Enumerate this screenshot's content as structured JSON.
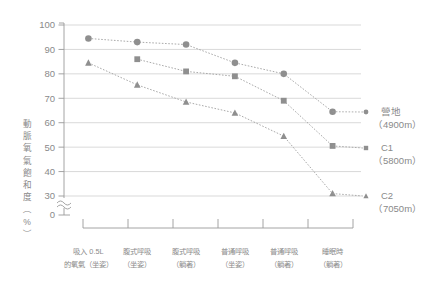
{
  "chart_data": {
    "type": "line",
    "title": "",
    "xlabel": "",
    "ylabel": "動脈氧氣飽和度（%）",
    "ylabel_chars": [
      "動",
      "脈",
      "氧",
      "氣",
      "飽",
      "和",
      "度",
      "（",
      "%",
      "）"
    ],
    "ylim": [
      30,
      100
    ],
    "grid": true,
    "axis_break": true,
    "axis_break_symbol": "≈",
    "legend_position": "right",
    "ytick_labels": [
      "100",
      "90",
      "80",
      "70",
      "60",
      "50",
      "40",
      "30",
      "0"
    ],
    "ytick_values": [
      100,
      90,
      80,
      70,
      60,
      50,
      40,
      30,
      0
    ],
    "categories": [
      "吸入 0.5L\n的氧氣（坐姿）",
      "腹式呼吸\n（坐姿）",
      "腹式呼吸\n（躺著）",
      "普通呼吸\n（坐姿）",
      "普通呼吸\n（躺著）",
      "睡眠時\n（躺著）"
    ],
    "categories_lines": [
      [
        "吸入 0.5L",
        "的氧氣（坐姿）"
      ],
      [
        "腹式呼吸",
        "（坐姿）"
      ],
      [
        "腹式呼吸",
        "（躺著）"
      ],
      [
        "普通呼吸",
        "（坐姿）"
      ],
      [
        "普通呼吸",
        "（躺著）"
      ],
      [
        "睡眠時",
        "（躺著）"
      ]
    ],
    "series": [
      {
        "name": "營地",
        "altitude": "（4900m）",
        "marker": "circle",
        "color": "#8f8f8f",
        "values": [
          94.5,
          93,
          92,
          84.5,
          80,
          64.5
        ]
      },
      {
        "name": "C1",
        "altitude": "（5800m）",
        "marker": "square",
        "color": "#8f8f8f",
        "values": [
          null,
          86,
          81,
          79,
          69,
          50.5
        ]
      },
      {
        "name": "C2",
        "altitude": "（7050m）",
        "marker": "triangle",
        "color": "#8f8f8f",
        "values": [
          84.5,
          75.5,
          68.5,
          64,
          54.5,
          31
        ]
      }
    ]
  },
  "legend": {
    "items": [
      {
        "label": "營地",
        "sublabel": "（4900m）",
        "marker": "circle-marker-icon"
      },
      {
        "label": "C1",
        "sublabel": "（5800m）",
        "marker": "square-marker-icon"
      },
      {
        "label": "C2",
        "sublabel": "（7050m）",
        "marker": "triangle-marker-icon"
      }
    ]
  },
  "colors": {
    "marker": "#8f8f8f",
    "line": "#9b9b9b",
    "grid": "#cfcfcf",
    "axis": "#9a9a9a",
    "text": "#8a8a8a",
    "background": "#ffffff"
  }
}
